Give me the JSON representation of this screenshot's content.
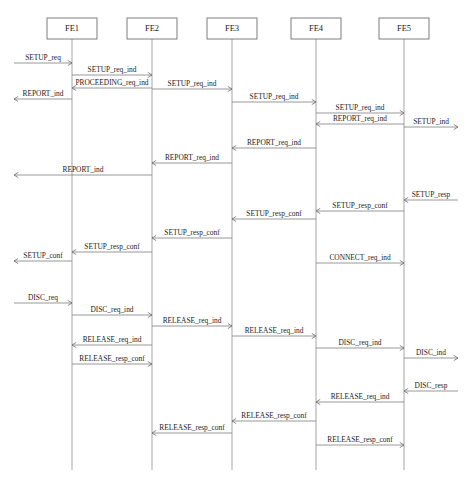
{
  "diagram": {
    "type": "sequence-diagram",
    "width": 466,
    "height": 484,
    "line_color": "#767676",
    "text_color": "#1c1c1c",
    "box_stroke": "#6f6f6f",
    "background": "#ffffff",
    "actors": [
      {
        "id": "FE1",
        "label": "FE1",
        "x": 72,
        "box_x": 47,
        "box_y": 18,
        "box_w": 50,
        "box_h": 21
      },
      {
        "id": "FE2",
        "label": "FE2",
        "x": 152,
        "box_x": 127,
        "box_y": 18,
        "box_w": 50,
        "box_h": 21
      },
      {
        "id": "FE3",
        "label": "FE3",
        "x": 232,
        "box_x": 207,
        "box_y": 18,
        "box_w": 50,
        "box_h": 21
      },
      {
        "id": "FE4",
        "label": "FE4",
        "x": 316,
        "box_x": 291,
        "box_y": 18,
        "box_w": 50,
        "box_h": 21
      },
      {
        "id": "FE5",
        "label": "FE5",
        "x": 404,
        "box_x": 379,
        "box_y": 18,
        "box_w": 50,
        "box_h": 21
      }
    ],
    "lifeline_top": 39,
    "lifeline_bottom": 470,
    "edge_left": 14,
    "edge_right": 458,
    "messages": [
      {
        "label": "SETUP_req",
        "from": "edge_left",
        "to": "FE1",
        "y": 63,
        "dir": "right"
      },
      {
        "label": "SETUP_req_ind",
        "from": "FE1",
        "to": "FE2",
        "y": 75,
        "dir": "right"
      },
      {
        "label": "PROCEEDING_req_ind",
        "from": "FE2",
        "to": "FE1",
        "y": 88,
        "dir": "left"
      },
      {
        "label": "SETUP_req_ind",
        "from": "FE2",
        "to": "FE3",
        "y": 89,
        "dir": "right"
      },
      {
        "label": "REPORT_ind",
        "from": "FE1",
        "to": "edge_left",
        "y": 99,
        "dir": "left"
      },
      {
        "label": "SETUP_req_ind",
        "from": "FE3",
        "to": "FE4",
        "y": 102,
        "dir": "right"
      },
      {
        "label": "SETUP_req_ind",
        "from": "FE4",
        "to": "FE5",
        "y": 113,
        "dir": "right"
      },
      {
        "label": "REPORT_req_ind",
        "from": "FE5",
        "to": "FE4",
        "y": 124,
        "dir": "left"
      },
      {
        "label": "SETUP_ind",
        "from": "FE5",
        "to": "edge_right",
        "y": 127,
        "dir": "right"
      },
      {
        "label": "REPORT_req_ind",
        "from": "FE4",
        "to": "FE3",
        "y": 148,
        "dir": "left"
      },
      {
        "label": "REPORT_req_ind",
        "from": "FE3",
        "to": "FE2",
        "y": 163,
        "dir": "left"
      },
      {
        "label": "REPORT_ind",
        "from": "FE2",
        "to": "edge_left",
        "y": 175,
        "dir": "left"
      },
      {
        "label": "SETUP_resp",
        "from": "edge_right",
        "to": "FE5",
        "y": 200,
        "dir": "left"
      },
      {
        "label": "SETUP_resp_conf",
        "from": "FE5",
        "to": "FE4",
        "y": 211,
        "dir": "left"
      },
      {
        "label": "SETUP_resp_conf",
        "from": "FE4",
        "to": "FE3",
        "y": 219,
        "dir": "left"
      },
      {
        "label": "SETUP_resp_conf",
        "from": "FE3",
        "to": "FE2",
        "y": 238,
        "dir": "left"
      },
      {
        "label": "SETUP_resp_conf",
        "from": "FE2",
        "to": "FE1",
        "y": 252,
        "dir": "left"
      },
      {
        "label": "SETUP_conf",
        "from": "FE1",
        "to": "edge_left",
        "y": 261,
        "dir": "left"
      },
      {
        "label": "CONNECT_req_ind",
        "from": "FE4",
        "to": "FE5",
        "y": 263,
        "dir": "right"
      },
      {
        "label": "DISC_req",
        "from": "edge_left",
        "to": "FE1",
        "y": 303,
        "dir": "right"
      },
      {
        "label": "DISC_req_ind",
        "from": "FE1",
        "to": "FE2",
        "y": 315,
        "dir": "right"
      },
      {
        "label": "RELEASE_req_ind",
        "from": "FE2",
        "to": "FE3",
        "y": 326,
        "dir": "right"
      },
      {
        "label": "RELEASE_req_ind",
        "from": "FE3",
        "to": "FE4",
        "y": 336,
        "dir": "right"
      },
      {
        "label": "RELEASE_req_ind",
        "from": "FE2",
        "to": "FE1",
        "y": 345,
        "dir": "left"
      },
      {
        "label": "DISC_req_ind",
        "from": "FE4",
        "to": "FE5",
        "y": 348,
        "dir": "right"
      },
      {
        "label": "DISC_ind",
        "from": "FE5",
        "to": "edge_right",
        "y": 358,
        "dir": "right"
      },
      {
        "label": "RELEASE_resp_conf",
        "from": "FE1",
        "to": "FE2",
        "y": 364,
        "dir": "right"
      },
      {
        "label": "DISC_resp",
        "from": "edge_right",
        "to": "FE5",
        "y": 391,
        "dir": "left"
      },
      {
        "label": "RELEASE_req_ind",
        "from": "FE5",
        "to": "FE4",
        "y": 402,
        "dir": "left"
      },
      {
        "label": "RELEASE_resp_conf",
        "from": "FE4",
        "to": "FE3",
        "y": 421,
        "dir": "left"
      },
      {
        "label": "RELEASE_resp_conf",
        "from": "FE3",
        "to": "FE2",
        "y": 433,
        "dir": "left"
      },
      {
        "label": "RELEASE_resp_conf",
        "from": "FE4",
        "to": "FE5",
        "y": 445,
        "dir": "right"
      }
    ]
  }
}
